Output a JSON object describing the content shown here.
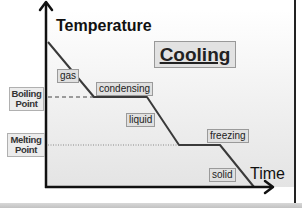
{
  "diagram": {
    "title": "Cooling",
    "y_axis_label": "Temperature",
    "x_axis_label": "Time",
    "phase_labels": {
      "gas": "gas",
      "condensing": "condensing",
      "liquid": "liquid",
      "freezing": "freezing",
      "solid": "solid"
    },
    "reference_lines": {
      "boiling": "Boiling Point",
      "boiling_line1": "Boiling",
      "boiling_line2": "Point",
      "melting": "Melting Point",
      "melting_line1": "Melting",
      "melting_line2": "Point"
    },
    "curve_segments": [
      {
        "phase": "gas",
        "type": "cooling"
      },
      {
        "phase": "condensing",
        "type": "plateau",
        "at": "Boiling Point"
      },
      {
        "phase": "liquid",
        "type": "cooling"
      },
      {
        "phase": "freezing",
        "type": "plateau",
        "at": "Melting Point"
      },
      {
        "phase": "solid",
        "type": "cooling"
      }
    ],
    "colors": {
      "line": "#3a3a3a",
      "axis": "#111111",
      "label_bg": "#e0e0e0"
    }
  }
}
